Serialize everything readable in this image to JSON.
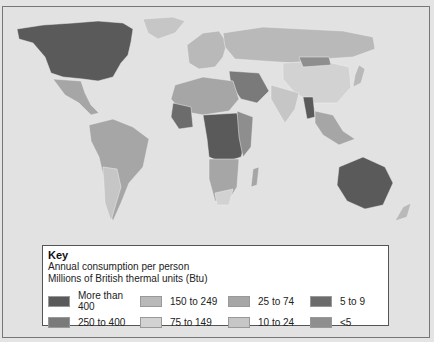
{
  "map": {
    "title": "World energy consumption per person",
    "colors": {
      "ocean": "#e2e2e2",
      "more_than_400": "#5a5a5a",
      "250_to_400": "#7a7a7a",
      "150_to_249": "#b9b9b9",
      "75_to_149": "#d2d2d2",
      "25_to_74": "#a6a6a6",
      "10_to_24": "#c6c6c6",
      "5_to_9": "#6c6c6c",
      "lt5": "#8e8e8e"
    }
  },
  "key": {
    "title": "Key",
    "subtitle1": "Annual consumption per person",
    "subtitle2": "Millions of British thermal units (Btu)",
    "items": [
      {
        "label": "More than 400",
        "color": "#5a5a5a"
      },
      {
        "label": "150 to 249",
        "color": "#b9b9b9"
      },
      {
        "label": "25 to 74",
        "color": "#a6a6a6"
      },
      {
        "label": "5 to 9",
        "color": "#6c6c6c"
      },
      {
        "label": "250 to 400",
        "color": "#7a7a7a"
      },
      {
        "label": "75 to 149",
        "color": "#d2d2d2"
      },
      {
        "label": "10 to 24",
        "color": "#c6c6c6"
      },
      {
        "label": "<5",
        "color": "#8e8e8e"
      }
    ]
  }
}
